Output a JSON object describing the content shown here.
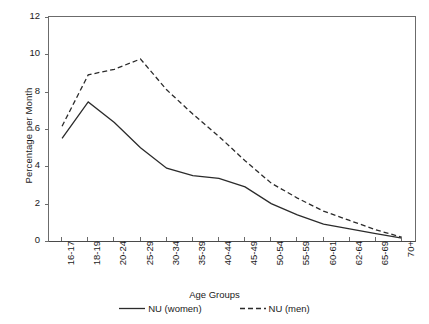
{
  "chart_data": {
    "type": "line",
    "title": "",
    "xlabel": "Age Groups",
    "ylabel": "Percentage per Month",
    "categories": [
      "16-17",
      "18-19",
      "20-24",
      "25-29",
      "30-34",
      "35-39",
      "40-44",
      "45-49",
      "50-54",
      "55-59",
      "60-61",
      "62-64",
      "65-69",
      "70+"
    ],
    "ylim": [
      0,
      12
    ],
    "yticks": [
      0,
      2,
      4,
      6,
      8,
      10,
      12
    ],
    "grid": false,
    "legend_position": "bottom",
    "series": [
      {
        "name": "NU (women)",
        "style": "solid",
        "color": "#2b2b2b",
        "values": [
          5.5,
          7.45,
          6.35,
          5.0,
          3.9,
          3.5,
          3.35,
          2.9,
          2.0,
          1.4,
          0.9,
          0.65,
          0.4,
          0.15
        ]
      },
      {
        "name": "NU (men)",
        "style": "dashed",
        "color": "#2b2b2b",
        "values": [
          6.15,
          8.9,
          9.2,
          9.75,
          8.1,
          6.8,
          5.6,
          4.3,
          3.1,
          2.3,
          1.6,
          1.1,
          0.6,
          0.2
        ]
      }
    ]
  },
  "axes": {
    "y_title": "Percentage per Month",
    "x_title": "Age Groups"
  },
  "legend": {
    "items": [
      {
        "label": "NU (women)"
      },
      {
        "label": "NU (men)"
      }
    ]
  },
  "colors": {
    "axis": "#6b6b6b",
    "line": "#2b2b2b",
    "background": "#ffffff"
  }
}
